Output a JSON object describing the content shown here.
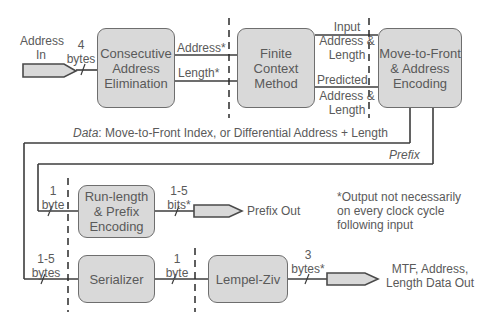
{
  "blocks": {
    "cae": "Consecutive Address Elimination",
    "fcm": "Finite Context Method",
    "mtf": "Move-to-Front & Address Encoding",
    "rle": "Run-length & Prefix Encoding",
    "serializer": "Serializer",
    "lz": "Lempel-Ziv"
  },
  "labels": {
    "address_in": "Address In",
    "in_width": "4 bytes",
    "address_star": "Address*",
    "length_star": "Length*",
    "input_addr_len": "Input Address & Length",
    "predicted": "Predicted",
    "predicted_addr_len": "Address & Length",
    "data_prefix": "Data",
    "data_text": ": Move-to-Front Index, or Differential Address + Length",
    "prefix": "Prefix",
    "rle_in": "1 byte",
    "rle_out": "1-5 bits*",
    "prefix_out": "Prefix Out",
    "ser_in": "1-5 bytes",
    "ser_out": "1 byte",
    "lz_out": "3 bytes*",
    "final_out": "MTF, Address, Length Data Out",
    "footnote": "*Output not necessarily on every clock cycle following input"
  }
}
